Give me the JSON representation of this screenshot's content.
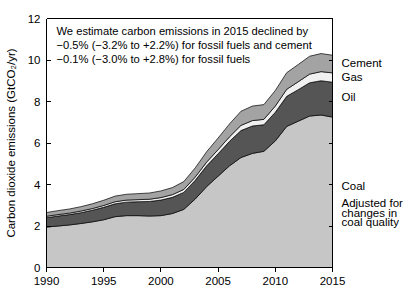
{
  "chart_data": {
    "type": "area",
    "title": "",
    "xlabel": "",
    "ylabel": "Carbon dioxide emissions (GtCO₂/yr)",
    "xlim": [
      1990,
      2015
    ],
    "ylim": [
      0,
      12
    ],
    "grid": false,
    "stacked": true,
    "legend_position": "right-inline",
    "x": [
      1990,
      1991,
      1992,
      1993,
      1994,
      1995,
      1996,
      1997,
      1998,
      1999,
      2000,
      2001,
      2002,
      2003,
      2004,
      2005,
      2006,
      2007,
      2008,
      2009,
      2010,
      2011,
      2012,
      2013,
      2014,
      2015
    ],
    "x_ticks": [
      1990,
      1995,
      2000,
      2005,
      2010,
      2015
    ],
    "x_tick_labels": [
      "1990",
      "1995",
      "2000",
      "2005",
      "2010",
      "2015"
    ],
    "y_ticks": [
      0,
      2,
      4,
      6,
      8,
      10,
      12
    ],
    "y_tick_labels": [
      "0",
      "2",
      "4",
      "6",
      "8",
      "10",
      "12"
    ],
    "series": [
      {
        "name": "Coal",
        "color": "#c6c6c6",
        "values": [
          1.95,
          2.0,
          2.05,
          2.12,
          2.2,
          2.3,
          2.45,
          2.5,
          2.5,
          2.48,
          2.5,
          2.6,
          2.8,
          3.3,
          3.9,
          4.4,
          4.9,
          5.3,
          5.5,
          5.6,
          6.1,
          6.8,
          7.05,
          7.3,
          7.35,
          7.25
        ]
      },
      {
        "name": "Oil",
        "color": "#555555",
        "values": [
          0.45,
          0.48,
          0.5,
          0.52,
          0.56,
          0.6,
          0.62,
          0.65,
          0.67,
          0.7,
          0.75,
          0.78,
          0.82,
          0.9,
          1.0,
          1.08,
          1.18,
          1.3,
          1.32,
          1.28,
          1.38,
          1.45,
          1.52,
          1.6,
          1.65,
          1.68
        ]
      },
      {
        "name": "Gas",
        "color": "#f0f0f0",
        "values": [
          0.07,
          0.07,
          0.07,
          0.08,
          0.08,
          0.09,
          0.1,
          0.1,
          0.1,
          0.11,
          0.12,
          0.13,
          0.14,
          0.16,
          0.18,
          0.2,
          0.22,
          0.25,
          0.26,
          0.26,
          0.3,
          0.34,
          0.38,
          0.42,
          0.44,
          0.45
        ]
      },
      {
        "name": "Cement",
        "color": "#a3a3a3",
        "values": [
          0.18,
          0.19,
          0.2,
          0.21,
          0.23,
          0.25,
          0.27,
          0.28,
          0.29,
          0.3,
          0.32,
          0.34,
          0.38,
          0.44,
          0.5,
          0.56,
          0.62,
          0.68,
          0.7,
          0.71,
          0.75,
          0.8,
          0.83,
          0.86,
          0.87,
          0.85
        ]
      }
    ],
    "annotations": [
      "We estimate carbon emissions in 2015 declined by",
      "−0.5% (−3.2% to +2.2%) for fossil fuels and cement",
      "−0.1% (−3.0% to +2.8%) for fossil fuels"
    ],
    "right_labels": [
      {
        "text": "Cement",
        "value": 9.85
      },
      {
        "text": "Gas",
        "value": 9.2
      },
      {
        "text": "Oil",
        "value": 8.2
      },
      {
        "text": "Coal",
        "value": 3.95
      },
      {
        "text": "Adjusted for",
        "value": 3.1
      },
      {
        "text": "changes in",
        "value": 2.65
      },
      {
        "text": "coal quality",
        "value": 2.2
      }
    ]
  }
}
